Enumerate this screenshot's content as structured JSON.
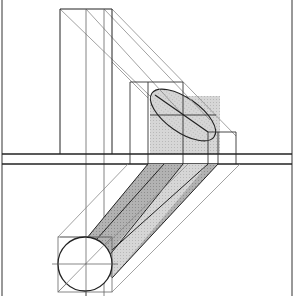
{
  "figure": {
    "colors": {
      "background": "#ffffff",
      "line": "#222222",
      "construction": "#777777",
      "shade_light": "#d4d4d4",
      "shade_dark": "#a8a8a8"
    },
    "views": [
      {
        "name": "front-view",
        "region": "upper"
      },
      {
        "name": "top-view",
        "region": "lower"
      }
    ],
    "elements": [
      "tall-prism",
      "cylinder-front-elevation",
      "ellipse-section",
      "ground-line",
      "circle-plan",
      "oblique-cylinder-band",
      "projection-lines"
    ]
  }
}
